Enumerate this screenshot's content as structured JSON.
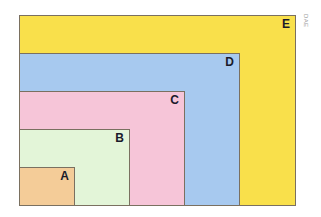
{
  "diagram": {
    "type": "nested-rectangles",
    "anchor": "bottom-left",
    "rectangles": [
      {
        "label": "E",
        "color": "#f9e04b",
        "x": 19,
        "y": 15,
        "w": 277,
        "h": 191
      },
      {
        "label": "D",
        "color": "#a7c9ef",
        "x": 19,
        "y": 53,
        "w": 221,
        "h": 153
      },
      {
        "label": "C",
        "color": "#f6c5d8",
        "x": 19,
        "y": 91,
        "w": 166,
        "h": 115
      },
      {
        "label": "B",
        "color": "#e3f5d8",
        "x": 19,
        "y": 129,
        "w": 111,
        "h": 77
      },
      {
        "label": "A",
        "color": "#f4cc98",
        "x": 19,
        "y": 167,
        "w": 56,
        "h": 39
      }
    ],
    "side_text": "DAE"
  }
}
